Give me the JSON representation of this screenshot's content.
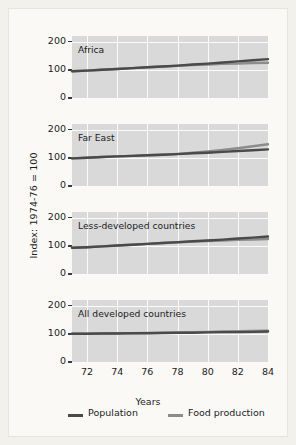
{
  "axis": {
    "y_label": "Index: 1974-76 = 100",
    "x_label": "Years",
    "y_ticks": [
      "200",
      "100",
      "0"
    ],
    "x_ticks": [
      "72",
      "74",
      "76",
      "78",
      "80",
      "82",
      "84"
    ]
  },
  "legend": {
    "items": [
      {
        "label": "Population",
        "color": "#4a4a4a"
      },
      {
        "label": "Food production",
        "color": "#8c8c8c"
      }
    ]
  },
  "chart_data": {
    "type": "line",
    "title": "",
    "xlabel": "Years",
    "ylabel": "Index: 1974-76 = 100",
    "xlim": [
      71,
      84
    ],
    "ylim": [
      0,
      220
    ],
    "yticks": [
      0,
      100,
      200
    ],
    "xticks": [
      72,
      74,
      76,
      78,
      80,
      82,
      84
    ],
    "grid": true,
    "legend_position": "bottom",
    "panel_layout": "4 stacked subplots sharing x-axis",
    "x": [
      71,
      72,
      73,
      74,
      75,
      76,
      77,
      78,
      79,
      80,
      81,
      82,
      83,
      84
    ],
    "panels": [
      {
        "name": "Africa",
        "series": [
          {
            "name": "Population",
            "color": "#4a4a4a",
            "values": [
              95,
              97,
              100,
              103,
              106,
              109,
              112,
              115,
              119,
              122,
              126,
              130,
              134,
              138
            ]
          },
          {
            "name": "Food production",
            "color": "#8c8c8c",
            "values": [
              95,
              97,
              100,
              103,
              106,
              109,
              112,
              114,
              117,
              119,
              121,
              122,
              124,
              125
            ]
          }
        ]
      },
      {
        "name": "Far East",
        "series": [
          {
            "name": "Population",
            "color": "#4a4a4a",
            "values": [
              98,
              100,
              103,
              105,
              107,
              109,
              111,
              113,
              116,
              118,
              121,
              124,
              127,
              130
            ]
          },
          {
            "name": "Food production",
            "color": "#8c8c8c",
            "values": [
              98,
              100,
              103,
              105,
              107,
              109,
              111,
              114,
              118,
              123,
              128,
              134,
              141,
              148
            ]
          }
        ]
      },
      {
        "name": "Less-developed countries",
        "series": [
          {
            "name": "Population",
            "color": "#4a4a4a",
            "values": [
              93,
              95,
              98,
              101,
              104,
              107,
              110,
              113,
              116,
              119,
              122,
              126,
              129,
              133
            ]
          },
          {
            "name": "Food production",
            "color": "#8c8c8c",
            "values": [
              93,
              95,
              98,
              101,
              104,
              107,
              110,
              112,
              115,
              117,
              119,
              121,
              122,
              124
            ]
          }
        ]
      },
      {
        "name": "All developed countries",
        "series": [
          {
            "name": "Population",
            "color": "#4a4a4a",
            "values": [
              100,
              100,
              101,
              101,
              102,
              102,
              103,
              104,
              104,
              105,
              106,
              106,
              107,
              108
            ]
          },
          {
            "name": "Food production",
            "color": "#8c8c8c",
            "values": [
              100,
              100,
              101,
              102,
              102,
              103,
              104,
              105,
              106,
              107,
              108,
              109,
              110,
              111
            ]
          }
        ]
      }
    ]
  }
}
